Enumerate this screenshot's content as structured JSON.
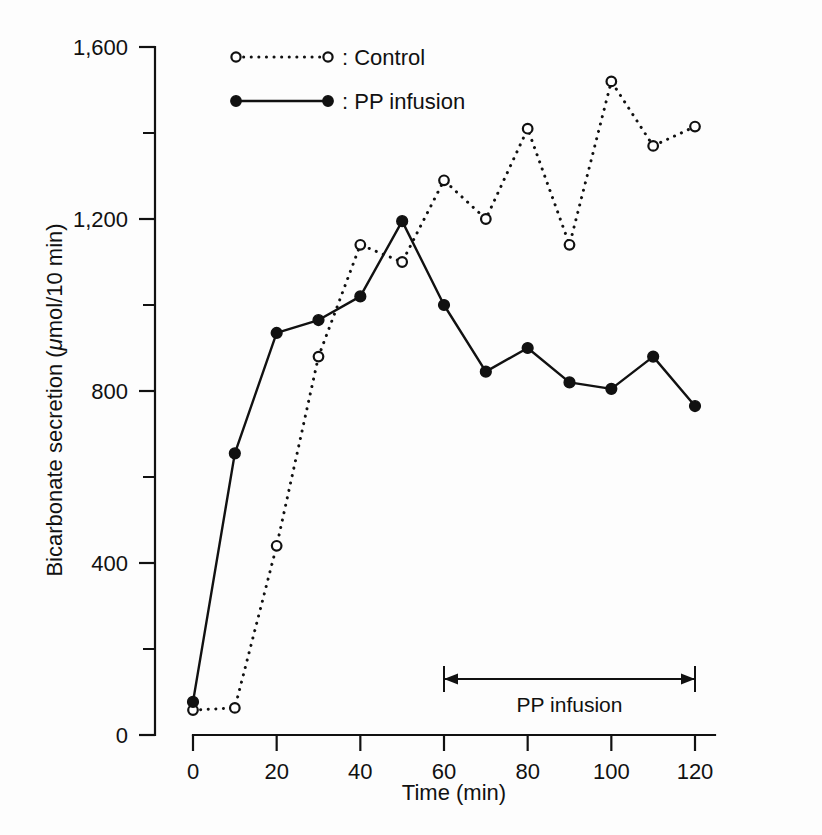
{
  "figure": {
    "background": "#fdfdfd",
    "ink_color": "#111111"
  },
  "axes": {
    "x_title": "Time (min)",
    "y_title_prefix": "Bicarbonate secretion (",
    "y_title_mu": "μ",
    "y_title_suffix": "mol/10 min)",
    "x_ticks": [
      "0",
      "20",
      "40",
      "60",
      "80",
      "100",
      "120"
    ],
    "y_ticks": [
      "0",
      "400",
      "800",
      "1,200",
      "1,600"
    ]
  },
  "legend": {
    "items": [
      {
        "label": ": Control",
        "marker": "open-circle",
        "line": "dotted"
      },
      {
        "label": ": PP infusion",
        "marker": "filled-circle",
        "line": "solid"
      }
    ]
  },
  "annotation": {
    "label": "PP infusion",
    "start_min": 60,
    "end_min": 120
  },
  "chart_data": {
    "type": "line",
    "title": "",
    "xlabel": "Time (min)",
    "ylabel": "Bicarbonate secretion (μmol/10 min)",
    "xlim": [
      0,
      125
    ],
    "ylim": [
      0,
      1600
    ],
    "xticks": [
      0,
      20,
      40,
      60,
      80,
      100,
      120
    ],
    "xticks_minor": [
      10,
      30,
      50,
      70,
      90,
      110
    ],
    "yticks": [
      0,
      400,
      800,
      1200,
      1600
    ],
    "yticks_minor": [
      200,
      600,
      1000,
      1400
    ],
    "grid": false,
    "legend_position": "top-center",
    "x": [
      0,
      10,
      20,
      30,
      40,
      50,
      60,
      70,
      80,
      90,
      100,
      110,
      120
    ],
    "series": [
      {
        "name": "Control",
        "marker": "open-circle",
        "linestyle": "dotted",
        "color": "#111111",
        "values": [
          58,
          63,
          440,
          880,
          1140,
          1100,
          1290,
          1200,
          1410,
          1140,
          1520,
          1370,
          1415
        ]
      },
      {
        "name": "PP infusion",
        "marker": "filled-circle",
        "linestyle": "solid",
        "color": "#111111",
        "values": [
          77,
          655,
          935,
          965,
          1020,
          1195,
          1000,
          845,
          900,
          820,
          805,
          880,
          765
        ]
      }
    ],
    "annotations": [
      {
        "text": "PP infusion",
        "type": "double-arrow",
        "x_start": 60,
        "x_end": 120,
        "y": 130
      }
    ]
  }
}
